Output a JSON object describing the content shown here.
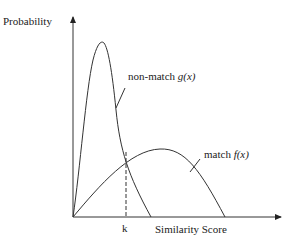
{
  "diagram": {
    "y_axis_label": "Probability",
    "x_axis_label": "Similarity Score",
    "threshold_label": "k",
    "curves": [
      {
        "id": "non-match",
        "label_text": "non-match ",
        "label_func": "g",
        "label_arg": "(x)"
      },
      {
        "id": "match",
        "label_text": "match ",
        "label_func": "f",
        "label_arg": "(x)"
      }
    ],
    "stroke_color": "#333333"
  }
}
